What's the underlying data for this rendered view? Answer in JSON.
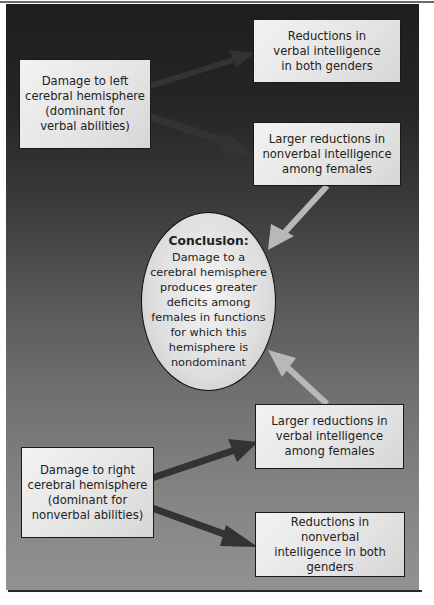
{
  "diagram": {
    "colors": {
      "background_top": "#1e1e1e",
      "background_bottom": "#929292",
      "box_fill": "#e8e8e8",
      "dark_arrow": "#3a3a3a",
      "light_arrow": "#b8b8b8"
    },
    "left_top_box": {
      "lines": [
        "Damage to left",
        "cerebral hemisphere",
        "(dominant for",
        "verbal abilities)"
      ]
    },
    "right_top_box_1": {
      "lines": [
        "Reductions in",
        "verbal intelligence",
        "in both genders"
      ]
    },
    "right_top_box_2": {
      "lines": [
        "Larger reductions in",
        "nonverbal intelligence",
        "among females"
      ]
    },
    "conclusion": {
      "title": "Conclusion:",
      "lines": [
        "Damage to a",
        "cerebral hemisphere",
        "produces greater",
        "deficits among",
        "females in functions",
        "for which this",
        "hemisphere is",
        "nondominant"
      ]
    },
    "right_bottom_box_1": {
      "lines": [
        "Larger reductions in",
        "verbal intelligence",
        "among females"
      ]
    },
    "left_bottom_box": {
      "lines": [
        "Damage to right",
        "cerebral hemisphere",
        "(dominant for",
        "nonverbal abilities)"
      ]
    },
    "right_bottom_box_2": {
      "lines": [
        "Reductions in nonverbal",
        "intelligence in both",
        "genders"
      ]
    }
  }
}
